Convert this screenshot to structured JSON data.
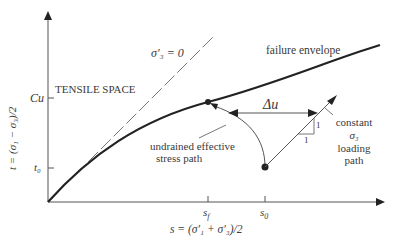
{
  "diagram": {
    "axes": {
      "y_label": "t = (σ₁ − σ₃)/2",
      "x_label": "s = (σ′₁ + σ′₃)/2",
      "y_ticks": [
        {
          "label": "Cu"
        },
        {
          "label": "t₀"
        }
      ],
      "x_ticks": [
        {
          "label": "s_f",
          "main": "s",
          "sub": "f"
        },
        {
          "label": "s₀",
          "main": "s",
          "sub": "0"
        }
      ]
    },
    "labels": {
      "sigma3_zero": "σ′₃ = 0",
      "tensile_space": "TENSILE SPACE",
      "failure_envelope": "failure envelope",
      "delta_u": "Δu",
      "undrained_line1": "undrained effective",
      "undrained_line2": "stress path",
      "constant_line1": "constant",
      "constant_line2": "σ₃",
      "constant_line3": "loading",
      "constant_line4": "path",
      "slope_rise": "1",
      "slope_run": "1"
    },
    "colors": {
      "line": "#222222",
      "thin_line": "#555555",
      "text": "#3a3a3a"
    }
  }
}
